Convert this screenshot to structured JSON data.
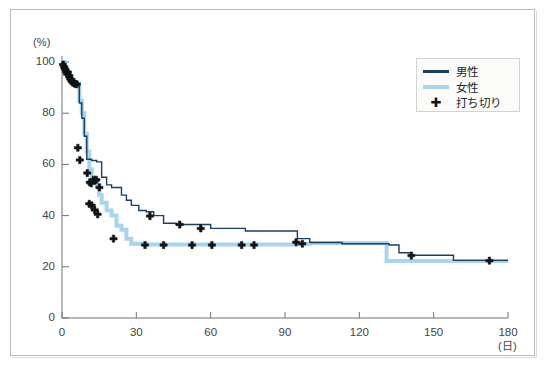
{
  "figure": {
    "background_color": "#ffffff",
    "frame_color": "#b9bcbe"
  },
  "legend": {
    "position": "top-right",
    "background_color": "#fbfbfa",
    "border_color": "#d2d4d5",
    "entries": [
      {
        "label": "男性",
        "type": "line",
        "color": "#1d3f5e"
      },
      {
        "label": "女性",
        "type": "line",
        "color": "#a8d4ec"
      },
      {
        "label": "打ち切り",
        "type": "marker",
        "glyph": "✚",
        "color": "#111418"
      }
    ]
  },
  "chart_data": {
    "type": "line",
    "title": "",
    "subtitle": "",
    "xlabel": "(日)",
    "ylabel": "(%)",
    "xlim": [
      0,
      180
    ],
    "ylim": [
      0,
      100
    ],
    "xticks": [
      0,
      30,
      60,
      90,
      120,
      150,
      180
    ],
    "xtick_labels": [
      "0",
      "30",
      "60",
      "90",
      "120",
      "150",
      "180"
    ],
    "yticks": [
      0,
      20,
      40,
      60,
      80,
      100
    ],
    "ytick_labels": [
      "0",
      "20",
      "40",
      "60",
      "80",
      "100"
    ],
    "grid": false,
    "legend_position": "upper right",
    "step_interpolation": "post",
    "series": [
      {
        "name": "男性",
        "color": "#1d3f5e",
        "line_width": 1.4,
        "x": [
          0,
          1,
          2,
          3,
          4,
          5,
          6,
          7,
          8,
          9,
          10,
          12,
          14,
          16,
          18,
          20,
          22,
          24,
          26,
          28,
          31,
          34,
          37,
          41,
          46,
          52,
          60,
          68,
          74,
          86,
          95,
          100,
          110,
          113,
          132,
          136,
          141,
          150,
          158,
          172,
          180
        ],
        "values": [
          100,
          98,
          96.5,
          95,
          93.5,
          92,
          91.5,
          84,
          78,
          71,
          62,
          61.5,
          61,
          55,
          52,
          51,
          51,
          48,
          46,
          44,
          42,
          41.5,
          40,
          37,
          36.5,
          36.5,
          35,
          35,
          34,
          34,
          31,
          29.5,
          29.5,
          29,
          28.5,
          25.5,
          24.5,
          24.5,
          22.5,
          22.5,
          22.5
        ]
      },
      {
        "name": "女性",
        "color": "#a8d4ec",
        "line_width": 4.0,
        "x": [
          0,
          1,
          2,
          3,
          4,
          5,
          6,
          7,
          8,
          9,
          10,
          11,
          12,
          13,
          14,
          15,
          16,
          18,
          20,
          22,
          24,
          26,
          28,
          34,
          50,
          70,
          90,
          95,
          100,
          110,
          120,
          131,
          140,
          150,
          165,
          180
        ],
        "values": [
          100,
          98,
          96,
          94.5,
          93,
          92,
          91.5,
          85,
          80,
          72,
          65,
          58,
          55,
          53,
          52,
          48,
          45,
          42,
          40,
          36,
          34.5,
          31,
          29,
          28.7,
          28.7,
          28.7,
          28.7,
          29,
          29.3,
          29.3,
          29.3,
          22.3,
          22.3,
          22.3,
          22.3,
          22.3
        ]
      }
    ],
    "censored_markers": {
      "name": "打ち切り",
      "glyph": "✚",
      "color": "#111418",
      "points": [
        {
          "x": 0.4,
          "y": 99.0
        },
        {
          "x": 0.8,
          "y": 98.0
        },
        {
          "x": 1.2,
          "y": 97.2
        },
        {
          "x": 1.6,
          "y": 96.2
        },
        {
          "x": 2.0,
          "y": 95.3
        },
        {
          "x": 2.4,
          "y": 96.0
        },
        {
          "x": 2.9,
          "y": 94.5
        },
        {
          "x": 3.3,
          "y": 93.4
        },
        {
          "x": 3.8,
          "y": 92.6
        },
        {
          "x": 4.3,
          "y": 92.0
        },
        {
          "x": 4.9,
          "y": 91.6
        },
        {
          "x": 5.4,
          "y": 91.4
        },
        {
          "x": 6.0,
          "y": 91.3
        },
        {
          "x": 6.4,
          "y": 66.5
        },
        {
          "x": 7.2,
          "y": 61.7
        },
        {
          "x": 10.2,
          "y": 56.6
        },
        {
          "x": 11.2,
          "y": 53.0
        },
        {
          "x": 11.8,
          "y": 52.6
        },
        {
          "x": 12.7,
          "y": 54.0
        },
        {
          "x": 13.3,
          "y": 53.7
        },
        {
          "x": 13.9,
          "y": 54.0
        },
        {
          "x": 15.1,
          "y": 51.0
        },
        {
          "x": 11.0,
          "y": 44.6
        },
        {
          "x": 12.0,
          "y": 44.0
        },
        {
          "x": 13.2,
          "y": 42.2
        },
        {
          "x": 14.4,
          "y": 40.5
        },
        {
          "x": 20.8,
          "y": 31.0
        },
        {
          "x": 33.5,
          "y": 28.5
        },
        {
          "x": 41.0,
          "y": 28.5
        },
        {
          "x": 52.5,
          "y": 28.5
        },
        {
          "x": 60.5,
          "y": 28.5
        },
        {
          "x": 72.5,
          "y": 28.5
        },
        {
          "x": 77.5,
          "y": 28.5
        },
        {
          "x": 35.5,
          "y": 39.8
        },
        {
          "x": 47.5,
          "y": 36.5
        },
        {
          "x": 56.0,
          "y": 35.0
        },
        {
          "x": 94.5,
          "y": 29.6
        },
        {
          "x": 97.0,
          "y": 29.0
        },
        {
          "x": 141.0,
          "y": 24.4
        },
        {
          "x": 172.5,
          "y": 22.4
        }
      ]
    }
  }
}
